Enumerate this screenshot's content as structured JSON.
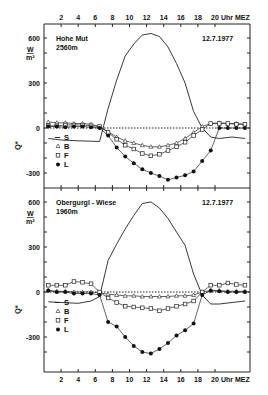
{
  "chart_data": [
    {
      "type": "line",
      "title": "Hohe Mut 2560m",
      "station": "Hohe Mut",
      "elevation": "2560m",
      "date": "12.7.1977",
      "xlabel": "Uhr MEZ",
      "ylabel": "Q*",
      "yunit_num": "W",
      "yunit_den": "m²",
      "x_ticks": [
        2,
        4,
        6,
        8,
        10,
        12,
        14,
        16,
        18,
        20
      ],
      "y_ticks": [
        600,
        300,
        0,
        -300
      ],
      "xlim": [
        0,
        24
      ],
      "ylim": [
        -400,
        700
      ],
      "legend": [
        "S",
        "B",
        "F",
        "L"
      ],
      "legend_position": "lower-left",
      "series": [
        {
          "name": "S",
          "marker": "none",
          "x": [
            0.5,
            2,
            4,
            6.5,
            7.5,
            8.5,
            9.5,
            10.5,
            11.5,
            12.5,
            13.5,
            14.5,
            15.5,
            16.5,
            17.5,
            18.5,
            19.5,
            20.5,
            22,
            23.5
          ],
          "values": [
            -70,
            -80,
            -85,
            -90,
            130,
            320,
            480,
            560,
            620,
            630,
            610,
            540,
            430,
            300,
            110,
            0,
            -60,
            -70,
            -60,
            -70
          ]
        },
        {
          "name": "B",
          "marker": "triangle-open",
          "x": [
            0.5,
            1.5,
            2.5,
            3.5,
            4.5,
            5.5,
            6.5,
            7.5,
            8.5,
            9.5,
            10.5,
            11.5,
            12.5,
            13.5,
            14.5,
            15.5,
            16.5,
            17.5,
            18.5,
            19.5,
            20.5,
            21.5,
            22.5,
            23.5
          ],
          "values": [
            40,
            35,
            35,
            30,
            30,
            25,
            10,
            -25,
            -60,
            -85,
            -100,
            -115,
            -125,
            -125,
            -115,
            -100,
            -70,
            -30,
            10,
            30,
            35,
            30,
            30,
            25
          ]
        },
        {
          "name": "F",
          "marker": "square-open",
          "x": [
            0.5,
            1.5,
            2.5,
            3.5,
            4.5,
            5.5,
            6.5,
            7.5,
            8.5,
            9.5,
            10.5,
            11.5,
            12.5,
            13.5,
            14.5,
            15.5,
            16.5,
            17.5,
            18.5,
            19.5,
            20.5,
            21.5,
            22.5,
            23.5
          ],
          "values": [
            15,
            15,
            20,
            20,
            20,
            15,
            10,
            -30,
            -75,
            -115,
            -140,
            -170,
            -185,
            -175,
            -150,
            -125,
            -95,
            -50,
            -10,
            30,
            30,
            30,
            25,
            25
          ]
        },
        {
          "name": "L",
          "marker": "circle-filled",
          "x": [
            0.5,
            1.5,
            2.5,
            3.5,
            4.5,
            5.5,
            6.5,
            7.5,
            8.5,
            9.5,
            10.5,
            11.5,
            12.5,
            13.5,
            14.5,
            15.5,
            16.5,
            17.5,
            18.5,
            19.5,
            20.5,
            21.5,
            22.5,
            23.5
          ],
          "values": [
            10,
            10,
            5,
            10,
            10,
            5,
            0,
            -50,
            -130,
            -190,
            -235,
            -275,
            -300,
            -320,
            -345,
            -330,
            -315,
            -290,
            -220,
            -150,
            0,
            0,
            0,
            0
          ]
        }
      ]
    },
    {
      "type": "line",
      "title": "Obergurgl-Wiese 1960m",
      "station": "Obergurgl-Wiese",
      "elevation": "1960m",
      "date": "12.7.1977",
      "xlabel": "Uhr MEZ",
      "ylabel": "Q*",
      "yunit_num": "W",
      "yunit_den": "m²",
      "x_ticks": [
        2,
        4,
        6,
        8,
        10,
        12,
        14,
        16,
        18,
        20
      ],
      "y_ticks": [
        600,
        300,
        0,
        -300
      ],
      "xlim": [
        0,
        24
      ],
      "ylim": [
        -400,
        700
      ],
      "legend": [
        "S",
        "B",
        "F",
        "L"
      ],
      "legend_position": "lower-left",
      "series": [
        {
          "name": "S",
          "marker": "none",
          "x": [
            0.5,
            2,
            4,
            5.5,
            6.5,
            7.5,
            8.5,
            9.5,
            10.5,
            11.5,
            12.5,
            13.5,
            14.5,
            15.5,
            16.5,
            17.5,
            18.5,
            19.5,
            20.5,
            22,
            23.5
          ],
          "values": [
            -65,
            -70,
            -75,
            -60,
            -30,
            210,
            320,
            420,
            510,
            590,
            600,
            560,
            490,
            400,
            310,
            120,
            -20,
            -80,
            -80,
            -70,
            -60
          ],
          "note": "curve"
        },
        {
          "name": "B",
          "marker": "triangle-open",
          "x": [
            0.5,
            1.5,
            2.5,
            3.5,
            4.5,
            5.5,
            6.5,
            7.5,
            8.5,
            9.5,
            10.5,
            11.5,
            12.5,
            13.5,
            14.5,
            15.5,
            16.5,
            17.5,
            18.5,
            19.5,
            20.5,
            21.5,
            22.5,
            23.5
          ],
          "values": [
            10,
            5,
            5,
            0,
            0,
            0,
            -5,
            -15,
            -20,
            -25,
            -25,
            -30,
            -30,
            -30,
            -30,
            -25,
            -25,
            -20,
            0,
            10,
            10,
            5,
            5,
            5
          ]
        },
        {
          "name": "F",
          "marker": "square-open",
          "x": [
            0.5,
            1.5,
            2.5,
            3.5,
            4.5,
            5.5,
            6.5,
            7.5,
            8.5,
            9.5,
            10.5,
            11.5,
            12.5,
            13.5,
            14.5,
            15.5,
            16.5,
            17.5,
            18.5,
            19.5,
            20.5,
            21.5,
            22.5,
            23.5
          ],
          "values": [
            45,
            45,
            45,
            70,
            65,
            55,
            0,
            -40,
            -70,
            -95,
            -100,
            -105,
            -110,
            -125,
            -110,
            -95,
            -80,
            -60,
            0,
            45,
            45,
            60,
            50,
            45
          ]
        },
        {
          "name": "L",
          "marker": "circle-filled",
          "x": [
            0.5,
            1.5,
            2.5,
            3.5,
            4.5,
            5.5,
            6.5,
            7.5,
            8.5,
            9.5,
            10.5,
            11.5,
            12.5,
            13.5,
            14.5,
            15.5,
            16.5,
            17.5,
            18.5,
            19.5,
            20.5,
            21.5,
            22.5,
            23.5
          ],
          "values": [
            10,
            0,
            0,
            -10,
            -10,
            -10,
            -20,
            -200,
            -230,
            -300,
            -360,
            -400,
            -410,
            -380,
            -340,
            -290,
            -255,
            -210,
            -20,
            10,
            5,
            0,
            0,
            0
          ]
        }
      ]
    }
  ],
  "axis": {
    "top_x_ticks": [
      "2",
      "4",
      "6",
      "8",
      "10",
      "12",
      "14",
      "16",
      "18",
      "20"
    ],
    "x_unit": "Uhr MEZ",
    "y_tick_labels": [
      "600",
      "300",
      "0",
      "-300"
    ]
  },
  "panels": [
    {
      "station": "Hohe Mut",
      "elevation": "2560m",
      "date": "12.7.1977",
      "unit_num": "W",
      "unit_den": "m²"
    },
    {
      "station": "Obergurgl - Wiese",
      "elevation": "1960m",
      "date": "12.7.1977",
      "unit_num": "W",
      "unit_den": "m²"
    }
  ],
  "legend": [
    {
      "symbol": "—",
      "label": "S"
    },
    {
      "symbol": "△",
      "label": "B"
    },
    {
      "symbol": "□",
      "label": "F"
    },
    {
      "symbol": "●",
      "label": "L"
    }
  ],
  "y_axis_label": "Q*"
}
